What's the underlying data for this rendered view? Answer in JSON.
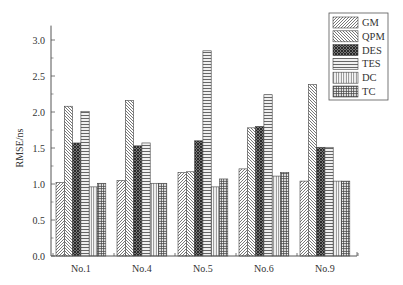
{
  "chart_data": {
    "type": "bar",
    "title": "",
    "xlabel": "",
    "ylabel": "RMSE/ns",
    "ylim": [
      0,
      3.2
    ],
    "yticks": [
      "0.0",
      "0.5",
      "1.0",
      "1.5",
      "2.0",
      "2.5",
      "3.0"
    ],
    "grid": false,
    "legend_position": "top-right",
    "categories": [
      "No.1",
      "No.4",
      "No.5",
      "No.6",
      "No.9"
    ],
    "series": [
      {
        "name": "GM",
        "pattern": "diagonal-forward",
        "values": [
          1.02,
          1.05,
          1.16,
          1.21,
          1.04
        ]
      },
      {
        "name": "QPM",
        "pattern": "diagonal-backward",
        "values": [
          2.08,
          2.16,
          1.17,
          1.78,
          2.38
        ]
      },
      {
        "name": "DES",
        "pattern": "dense-crosshatch",
        "values": [
          1.57,
          1.53,
          1.6,
          1.8,
          1.51
        ]
      },
      {
        "name": "TES",
        "pattern": "horizontal-lines",
        "values": [
          2.01,
          1.57,
          2.85,
          2.24,
          1.51
        ]
      },
      {
        "name": "DC",
        "pattern": "vertical-lines",
        "values": [
          0.96,
          1.01,
          0.96,
          1.11,
          1.04
        ]
      },
      {
        "name": "TC",
        "pattern": "grid",
        "values": [
          1.01,
          1.01,
          1.07,
          1.16,
          1.04
        ]
      }
    ]
  },
  "colors": {
    "axis": "#555555",
    "bar_stroke": "#444444",
    "pattern_ink": "#555555"
  }
}
